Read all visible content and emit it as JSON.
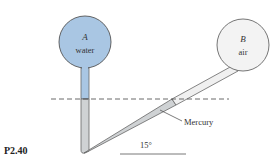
{
  "figure": {
    "problem_label": "P2.40",
    "tank_a": {
      "letter": "A",
      "fluid": "water",
      "fill": "#a9c6e3"
    },
    "tank_b": {
      "letter": "B",
      "fluid": "air",
      "fill": "#f3f3f3"
    },
    "manometer_fluid_label": "Mercury",
    "mercury_fill": "#cfd2d4",
    "angle_label": "15°",
    "outline_color": "#555555"
  }
}
